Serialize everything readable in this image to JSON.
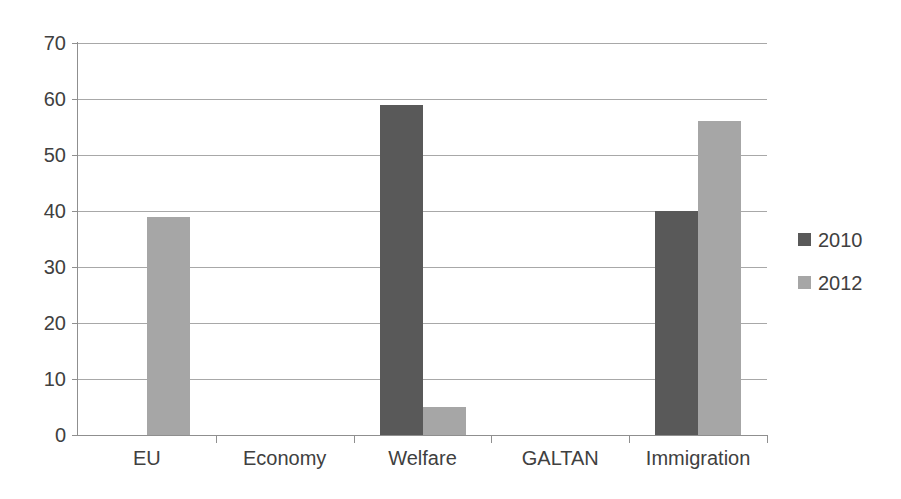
{
  "chart_data": {
    "type": "bar",
    "title": "",
    "subtitle": "",
    "xlabel": "",
    "ylabel": "",
    "categories": [
      "EU",
      "Economy",
      "Welfare",
      "GALTAN",
      "Immigration"
    ],
    "series": [
      {
        "name": "2010",
        "color": "#595959",
        "values": [
          0,
          0,
          59,
          0,
          40
        ]
      },
      {
        "name": "2012",
        "color": "#a6a6a6",
        "values": [
          39,
          0,
          5,
          0,
          56
        ]
      }
    ],
    "ylim": [
      0,
      70
    ],
    "yticks": [
      0,
      10,
      20,
      30,
      40,
      50,
      60,
      70
    ],
    "ytick_labels": [
      "0",
      "10",
      "20",
      "30",
      "40",
      "50",
      "60",
      "70"
    ],
    "grid": true,
    "grid_axis": "y",
    "legend": true,
    "legend_position": "right",
    "legend_entries": [
      "2010",
      "2012"
    ],
    "annotations": []
  },
  "axes": {
    "y": {
      "ticks": [
        {
          "value": 70,
          "label": "70"
        },
        {
          "value": 60,
          "label": "60"
        },
        {
          "value": 50,
          "label": "50"
        },
        {
          "value": 40,
          "label": "40"
        },
        {
          "value": 30,
          "label": "30"
        },
        {
          "value": 20,
          "label": "20"
        },
        {
          "value": 10,
          "label": "10"
        },
        {
          "value": 0,
          "label": "0"
        }
      ]
    },
    "x": {
      "categories": [
        {
          "label": "EU"
        },
        {
          "label": "Economy"
        },
        {
          "label": "Welfare"
        },
        {
          "label": "GALTAN"
        },
        {
          "label": "Immigration"
        }
      ]
    }
  },
  "legend": {
    "items": [
      {
        "label": "2010",
        "color": "#595959"
      },
      {
        "label": "2012",
        "color": "#a6a6a6"
      }
    ]
  },
  "colors": {
    "series_2010": "#595959",
    "series_2012": "#a6a6a6",
    "gridline": "#a8a8a8",
    "axis": "#8f8f8f",
    "text": "#404040",
    "background": "#ffffff"
  }
}
